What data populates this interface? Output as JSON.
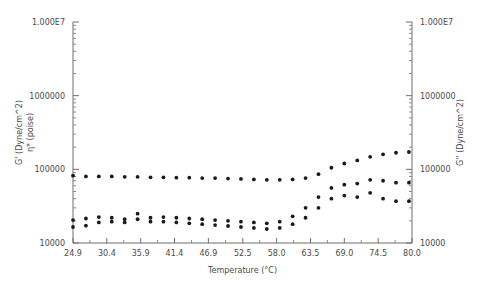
{
  "chart_data": {
    "type": "scatter",
    "title": "",
    "xlabel": "Temperature (°C)",
    "ylabel_left_line1": "G' (Dyne/cm^2)",
    "ylabel_left_line2": "η* (poise)",
    "ylabel_right": "G'' (Dyne/cm^2)",
    "x_ticklabels": [
      "24.9",
      "30.4",
      "35.9",
      "41.4",
      "46.9",
      "52.5",
      "58.0",
      "63.5",
      "69.0",
      "74.5",
      "80.0"
    ],
    "x_tickvalues": [
      24.9,
      30.4,
      35.9,
      41.4,
      46.9,
      52.5,
      58.0,
      63.5,
      69.0,
      74.5,
      80.0
    ],
    "y_ticklabels_left": [
      "1.000E7",
      "1000000",
      "100000",
      "10000"
    ],
    "y_ticklabels_right": [
      "1.000E7",
      "1000000",
      "100000",
      "10000"
    ],
    "y_tickvalues": [
      10000000,
      1000000,
      100000,
      10000
    ],
    "xlim": [
      24.9,
      80.0
    ],
    "ylim": [
      10000,
      10000000
    ],
    "yscale": "log",
    "grid": false,
    "legend": "none",
    "marker": "filled-circle",
    "series": [
      {
        "name": "η* (poise)",
        "axis": "left",
        "x": [
          24.9,
          27.0,
          29.1,
          31.2,
          33.3,
          35.4,
          37.5,
          39.6,
          41.7,
          43.8,
          45.9,
          48.0,
          50.1,
          52.2,
          54.3,
          56.4,
          58.5,
          60.6,
          62.7,
          64.8,
          66.9,
          69.0,
          71.1,
          73.2,
          75.3,
          77.4,
          79.5
        ],
        "y": [
          82000,
          80000,
          80000,
          80000,
          79000,
          79000,
          78000,
          78000,
          77000,
          77000,
          76000,
          76000,
          75000,
          74000,
          73000,
          72000,
          72000,
          73000,
          76000,
          86000,
          105000,
          120000,
          132000,
          148000,
          160000,
          168000,
          172000
        ]
      },
      {
        "name": "G' (Dyne/cm^2)",
        "axis": "left",
        "x": [
          24.9,
          27.0,
          29.1,
          31.2,
          33.3,
          35.4,
          37.5,
          39.6,
          41.7,
          43.8,
          45.9,
          48.0,
          50.1,
          52.2,
          54.3,
          56.4,
          58.5,
          60.6,
          62.7,
          64.8,
          66.9,
          69.0,
          71.1,
          73.2,
          75.3,
          77.4,
          79.5
        ],
        "y": [
          16500,
          17200,
          19000,
          19500,
          19000,
          25000,
          19500,
          19500,
          19000,
          18500,
          18000,
          17500,
          17000,
          16500,
          16000,
          15500,
          16000,
          18000,
          22000,
          30000,
          40000,
          44000,
          42000,
          48000,
          40000,
          37000,
          37000
        ]
      },
      {
        "name": "G'' (Dyne/cm^2)",
        "axis": "right",
        "x": [
          24.9,
          27.0,
          29.1,
          31.2,
          33.3,
          35.4,
          37.5,
          39.6,
          41.7,
          43.8,
          45.9,
          48.0,
          50.1,
          52.2,
          54.3,
          56.4,
          58.5,
          60.6,
          62.7,
          64.8,
          66.9,
          69.0,
          71.1,
          73.2,
          75.3,
          77.4,
          79.5
        ],
        "y": [
          20500,
          21500,
          22500,
          22000,
          21000,
          21000,
          22000,
          22500,
          22000,
          21500,
          21000,
          20500,
          20000,
          19500,
          19000,
          18500,
          19500,
          23000,
          30000,
          42000,
          56000,
          62000,
          64000,
          72000,
          70000,
          66000,
          66000
        ]
      }
    ]
  },
  "axes_geometry": {
    "plot_left_px": 73,
    "plot_right_px": 412,
    "plot_top_px": 22,
    "plot_bottom_px": 243
  }
}
